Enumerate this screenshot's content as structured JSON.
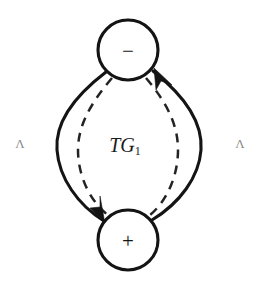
{
  "figure": {
    "name": "TG1 bigon diagram",
    "background_color": "#ffffff",
    "stroke_color": "#141414",
    "dashed_stroke_color": "#232323",
    "faint_label_color": "#8c8c8c",
    "width": 262,
    "height": 287
  },
  "nodes": [
    {
      "id": "node-minus",
      "label": "−",
      "role": "negative-node",
      "cx": 128,
      "cy": 50,
      "r": 30
    },
    {
      "id": "node-plus",
      "label": "+",
      "role": "positive-node",
      "cx": 128,
      "cy": 240,
      "r": 30
    }
  ],
  "center_label": {
    "main": "TG",
    "subscript": "1",
    "full": "TG₁",
    "x": 128,
    "y": 145
  },
  "side_labels": [
    {
      "id": "label-left",
      "text": "Λ",
      "x": 20,
      "y": 143
    },
    {
      "id": "label-right",
      "text": "Λ",
      "x": 240,
      "y": 143
    }
  ],
  "edges": [
    {
      "id": "edge-left-solid",
      "style": "solid",
      "direction": "minus-to-plus",
      "arrow": "at-plus-node",
      "description": "outer left solid curved arrow from the minus node down to the plus node"
    },
    {
      "id": "edge-right-solid",
      "style": "solid",
      "direction": "plus-to-minus",
      "arrow": "at-minus-node",
      "description": "outer right solid curved arrow from the plus node up to the minus node"
    },
    {
      "id": "edge-left-dashed",
      "style": "dashed",
      "direction": "none",
      "arrow": "none",
      "description": "inner left dashed arc between the two nodes"
    },
    {
      "id": "edge-right-dashed",
      "style": "dashed",
      "direction": "none",
      "arrow": "none",
      "description": "inner right dashed arc between the two nodes"
    }
  ]
}
